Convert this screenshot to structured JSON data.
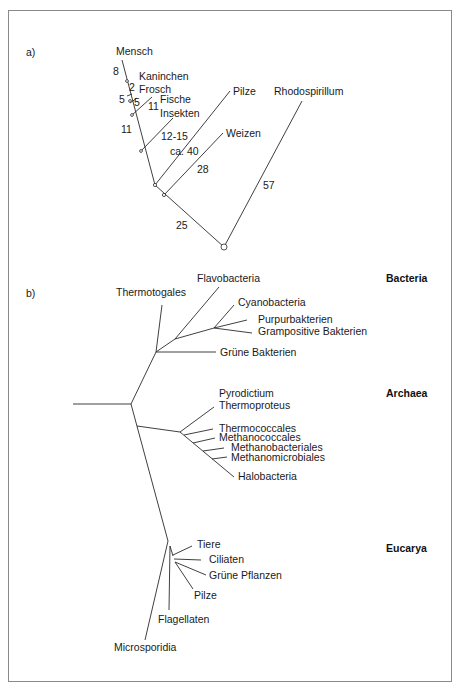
{
  "panel_a": {
    "label": "a)",
    "taxa": {
      "mensch": "Mensch",
      "kaninchen": "Kaninchen",
      "frosch": "Frosch",
      "fische": "Fische",
      "insekten": "Insekten",
      "pilze": "Pilze",
      "weizen": "Weizen",
      "rhodospirillum": "Rhodospirillum"
    },
    "distances": {
      "d_mensch": "8",
      "d_kaninchen": "2",
      "d_5a": "5",
      "d_frosch": "5",
      "d_fische": "11",
      "d_11": "11",
      "d_insekten": "12-15",
      "d_pilze": "ca. 40",
      "d_weizen": "28",
      "d_root": "25",
      "d_rhodo": "57"
    }
  },
  "panel_b": {
    "label": "b)",
    "domains": {
      "bacteria": "Bacteria",
      "archaea": "Archaea",
      "eucarya": "Eucarya"
    },
    "bacteria": {
      "thermotogales": "Thermotogales",
      "flavobacteria": "Flavobacteria",
      "cyanobacteria": "Cyanobacteria",
      "purpurbakterien": "Purpurbakterien",
      "grampositive": "Grampositive Bakterien",
      "gruene_bakterien": "Grüne Bakterien"
    },
    "archaea": {
      "pyrodictium": "Pyrodictium",
      "thermoproteus": "Thermoproteus",
      "thermococcales": "Thermococcales",
      "methanococcales": "Methanococcales",
      "methanobacteriales": "Methanobacteriales",
      "methanomicrobiales": "Methanomicrobiales",
      "halobacteria": "Halobacteria"
    },
    "eucarya": {
      "tiere": "Tiere",
      "ciliaten": "Ciliaten",
      "gruene_pflanzen": "Grüne Pflanzen",
      "pilze": "Pilze",
      "flagellaten": "Flagellaten",
      "microsporidia": "Microsporidia"
    }
  }
}
